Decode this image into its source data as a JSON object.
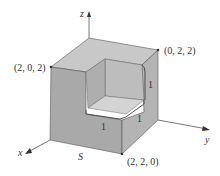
{
  "diagram": {
    "title": "",
    "axes": {
      "x": {
        "label": "x"
      },
      "y": {
        "label": "y"
      },
      "z": {
        "label": "z"
      }
    },
    "points": [
      {
        "label": "(2, 0, 2)"
      },
      {
        "label": "(0, 2, 2)"
      },
      {
        "label": "(2, 2, 0)"
      }
    ],
    "surface_label": "S",
    "edge_labels": [
      "1",
      "1",
      "1"
    ],
    "colors": {
      "face_front": "#a9a9a9",
      "face_right": "#b4b4b4",
      "face_top": "#c8c8c8",
      "inner_floor": "#d2d2d2",
      "inner_wall": "#bdbdbd",
      "edge": "#555555",
      "axis": "#555555"
    }
  }
}
